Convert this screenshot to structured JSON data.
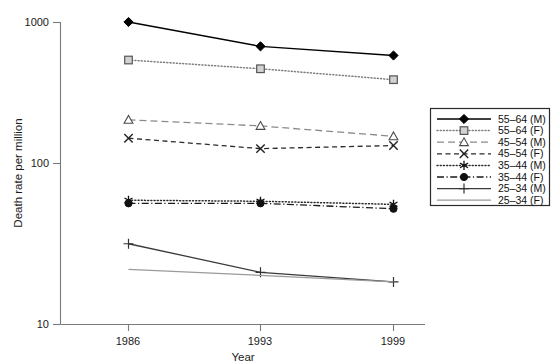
{
  "chart_data": {
    "type": "line",
    "title": "",
    "xlabel": "Year",
    "ylabel": "Death rate per million",
    "x": [
      1986,
      1993,
      1999
    ],
    "xticklabels": [
      "1986",
      "1993",
      "1999"
    ],
    "yscale": "log",
    "ylim": [
      10,
      1000
    ],
    "yticks": [
      10,
      100,
      1000
    ],
    "yticklabels": [
      "10",
      "100",
      "1000"
    ],
    "grid": false,
    "legend_position": "right",
    "series": [
      {
        "name": "55–64 (M)",
        "marker": "filled-diamond",
        "linestyle": "solid",
        "color": "#000000",
        "values": [
          1000,
          690,
          600
        ]
      },
      {
        "name": "55–64 (F)",
        "marker": "open-square",
        "linestyle": "dotted",
        "color": "#7d7d7d",
        "values": [
          560,
          490,
          415
        ]
      },
      {
        "name": "45–54 (M)",
        "marker": "open-triangle",
        "linestyle": "dashed-long",
        "color": "#8a8a8a",
        "values": [
          225,
          205,
          175
        ]
      },
      {
        "name": "45–54 (F)",
        "marker": "cross-x",
        "linestyle": "dashed",
        "color": "#2b2b2b",
        "values": [
          170,
          145,
          152
        ]
      },
      {
        "name": "35–44 (M)",
        "marker": "asterisk",
        "linestyle": "dotted",
        "color": "#2b2b2b",
        "values": [
          66,
          65,
          62
        ]
      },
      {
        "name": "35–44 (F)",
        "marker": "filled-circle",
        "linestyle": "dash-dot",
        "color": "#1a1a1a",
        "values": [
          63,
          63,
          58
        ]
      },
      {
        "name": "25–34 (M)",
        "marker": "plus",
        "linestyle": "solid",
        "color": "#3a3a3a",
        "values": [
          34,
          22,
          19
        ]
      },
      {
        "name": "25–34 (F)",
        "marker": "none",
        "linestyle": "solid",
        "color": "#9a9a9a",
        "values": [
          23,
          21,
          19
        ]
      }
    ]
  },
  "axes": {
    "y_title": "Death rate per million",
    "x_title": "Year",
    "y_tick_1": "1000",
    "y_tick_2": "100",
    "y_tick_3": "10",
    "x_tick_1": "1986",
    "x_tick_2": "1993",
    "x_tick_3": "1999"
  },
  "legend": {
    "items": [
      {
        "label": "55–64 (M)"
      },
      {
        "label": "55–64 (F)"
      },
      {
        "label": "45–54 (M)"
      },
      {
        "label": "45–54 (F)"
      },
      {
        "label": "35–44 (M)"
      },
      {
        "label": "35–44 (F)"
      },
      {
        "label": "25–34 (M)"
      },
      {
        "label": "25–34 (F)"
      }
    ]
  }
}
